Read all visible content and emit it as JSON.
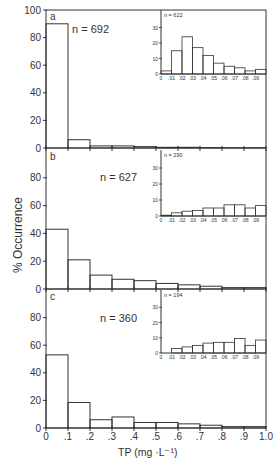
{
  "figure": {
    "ylabel": "% Occurrence",
    "xlabel": "TP (mg ·L⁻¹)",
    "x_ticks": [
      "0",
      ".1",
      ".2",
      ".3",
      ".4",
      ".5",
      ".6",
      ".7",
      ".8",
      ".9",
      "1.0"
    ],
    "y_ticks": [
      "0",
      "20",
      "40",
      "60",
      "80",
      "100"
    ],
    "inset_x_ticks": [
      "0",
      ".01",
      ".02",
      ".03",
      ".04",
      ".05",
      ".06",
      ".07",
      ".08",
      ".09"
    ],
    "inset_y_ticks": [
      "0",
      "10",
      "20",
      "30"
    ]
  },
  "chart_data": [
    {
      "type": "bar",
      "panel": "a",
      "annotation": "n = 692",
      "xlabel": "TP (mg ·L⁻¹)",
      "ylabel": "% Occurrence",
      "bin_edges": [
        0,
        0.1,
        0.2,
        0.3,
        0.4,
        0.5,
        0.6,
        0.7,
        0.8,
        0.9,
        1.0
      ],
      "values": [
        90,
        6,
        1.5,
        1.5,
        1,
        0.5,
        0.5,
        0.3,
        0.2,
        0.2
      ],
      "ylim": [
        0,
        100
      ],
      "inset": {
        "annotation": "n = 622",
        "bin_edges": [
          0,
          0.01,
          0.02,
          0.03,
          0.04,
          0.05,
          0.06,
          0.07,
          0.08,
          0.09,
          0.1
        ],
        "values": [
          2,
          15,
          24,
          17,
          12,
          7,
          5,
          4,
          2,
          3
        ],
        "ylim": [
          0,
          40
        ]
      }
    },
    {
      "type": "bar",
      "panel": "b",
      "annotation": "n = 627",
      "bin_edges": [
        0,
        0.1,
        0.2,
        0.3,
        0.4,
        0.5,
        0.6,
        0.7,
        0.8,
        0.9,
        1.0
      ],
      "values": [
        43,
        21,
        10,
        7,
        6,
        4,
        3,
        2,
        1,
        1
      ],
      "ylim": [
        0,
        100
      ],
      "inset": {
        "annotation": "n = 290",
        "bin_edges": [
          0,
          0.01,
          0.02,
          0.03,
          0.04,
          0.05,
          0.06,
          0.07,
          0.08,
          0.09,
          0.1
        ],
        "values": [
          0.5,
          2,
          3,
          3.5,
          5,
          5,
          7,
          7,
          5,
          6.5
        ],
        "ylim": [
          0,
          40
        ]
      }
    },
    {
      "type": "bar",
      "panel": "c",
      "annotation": "n = 360",
      "bin_edges": [
        0,
        0.1,
        0.2,
        0.3,
        0.4,
        0.5,
        0.6,
        0.7,
        0.8,
        0.9,
        1.0
      ],
      "values": [
        53,
        18.5,
        6,
        8,
        4,
        4,
        3,
        2,
        1,
        1
      ],
      "ylim": [
        0,
        100
      ],
      "inset": {
        "annotation": "n = 194",
        "bin_edges": [
          0,
          0.01,
          0.02,
          0.03,
          0.04,
          0.05,
          0.06,
          0.07,
          0.08,
          0.09,
          0.1
        ],
        "values": [
          0,
          3,
          4,
          5,
          6.5,
          7,
          7,
          9.5,
          5,
          8.5
        ],
        "ylim": [
          0,
          40
        ]
      }
    }
  ]
}
